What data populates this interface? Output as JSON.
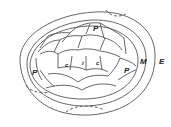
{
  "diagram": {
    "type": "biological cross-section (leaf bud / tissue layers)",
    "labels": {
      "p_top": "P",
      "p_left": "P",
      "p_right": "P",
      "c_left": "c",
      "i_center": "i",
      "c_right": "c",
      "m": "M",
      "e": "E"
    },
    "colors": {
      "line": "#555555",
      "background": "#ffffff",
      "text": "#222222"
    }
  }
}
